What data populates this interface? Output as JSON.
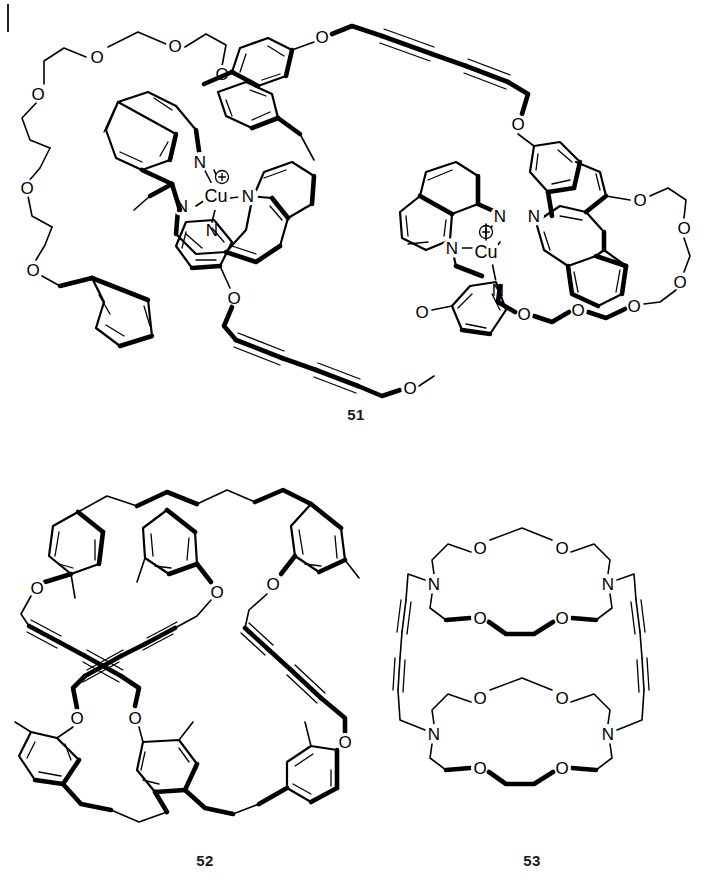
{
  "page": {
    "background_color": "#ffffff",
    "ink_color": "#000000",
    "width": 712,
    "height": 896,
    "margin_rule_visible": true
  },
  "figures": [
    {
      "id": "fig-51",
      "caption": "51",
      "caption_position": "below-center",
      "description": "Dinuclear copper(I) catenane / trefoil precursor: two Cu(+) bis(phenanthroline) complexes bridged by butadiyne-linked bis(aryl ether) loops and pentaethyleneglycol crown chains",
      "metals": [
        {
          "symbol": "Cu",
          "charge": "+",
          "charge_glyph": "circled-plus",
          "coordination": 4
        },
        {
          "symbol": "Cu",
          "charge": "+",
          "charge_glyph": "circled-plus",
          "coordination": 4
        }
      ],
      "heteroatom_labels": [
        "N",
        "O",
        "Cu"
      ],
      "counts": {
        "nitrogen_labels": 8,
        "oxygen_labels": 16,
        "copper_centers": 2,
        "diyne_linkers": 2
      },
      "linker_type": "butadiyne (C≡C–C≡C)"
    },
    {
      "id": "fig-52",
      "caption": "52",
      "caption_position": "below-center",
      "description": "Hexa-aryl cyclophane macrocycle with methyl and aryl-ether substituents, joined by crossing butadiyne bridges",
      "heteroatom_labels": [
        "O"
      ],
      "counts": {
        "oxygen_labels": 6,
        "aryl_rings": 6,
        "methyl_groups": 6,
        "diyne_linkers": 3
      },
      "linker_type": "butadiyne (C≡C–C≡C)"
    },
    {
      "id": "fig-53",
      "caption": "53",
      "caption_position": "below-center",
      "description": "Two diaza-18-crown-6 macrocycles linked on both sides by butadiyne bridges",
      "heteroatom_labels": [
        "N",
        "O"
      ],
      "counts": {
        "nitrogen_labels": 4,
        "oxygen_labels": 8,
        "macrocycles": 2,
        "diyne_linkers": 2
      },
      "linker_type": "butadiyne (C≡C–C≡C)"
    }
  ],
  "atom_labels": {
    "nitrogen": "N",
    "oxygen": "O",
    "copper": "Cu",
    "charge": "⊕"
  },
  "captions": {
    "fig51": "51",
    "fig52": "52",
    "fig53": "53"
  }
}
